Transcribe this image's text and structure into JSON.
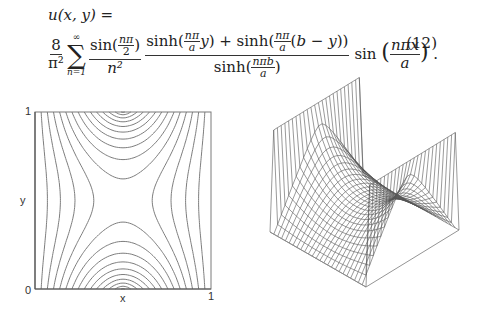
{
  "equation": {
    "lhs": "u(x, y) =",
    "coefficient_num": "8",
    "coefficient_den": "π²",
    "sum_upper": "∞",
    "sum_lower": "n=1",
    "term1_num": "sin(nπ/2)",
    "term1_den": "n²",
    "term2_num": "sinh(nπ/a · y) + sinh(nπ/a · (b − y))",
    "term2_den": "sinh(nπb/a)",
    "term3": "sin(nπx/a)",
    "number": "(12)"
  },
  "contour_plot": {
    "x_label": "x",
    "y_label": "y",
    "x_ticks": [
      "0",
      "1"
    ],
    "y_ticks": [
      "0",
      "1"
    ],
    "line_color": "#6e6e6e",
    "frame_color": "#7a7a7a"
  },
  "surface_plot": {
    "type": "wireframe-3d",
    "mesh_color": "#555555",
    "grid_lines": 25
  },
  "chart_data": [
    {
      "type": "contour",
      "title": "",
      "xlabel": "x",
      "ylabel": "y",
      "xlim": [
        0,
        1
      ],
      "ylim": [
        0,
        1
      ],
      "function": "u(x,y) series solution, a=b=1",
      "levels": 12
    },
    {
      "type": "surface",
      "title": "",
      "function": "u(x,y) series solution, a=b=1",
      "grid": "25x25 wireframe"
    }
  ]
}
